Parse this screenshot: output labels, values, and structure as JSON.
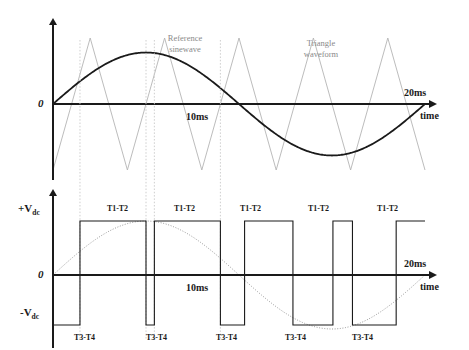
{
  "figure": {
    "width": 469,
    "height": 350,
    "colors": {
      "ink": "#1a1a1a",
      "carrier": "#b4b4b4",
      "guide": "#c8c8c8",
      "annotation": "#8a8a8a",
      "background": "#ffffff"
    }
  },
  "chart_data": [
    {
      "type": "line",
      "id": "modulation-comparison",
      "title": "",
      "xlabel": "time",
      "ylabel": "",
      "xlim": [
        0,
        20
      ],
      "ylim": [
        -1.25,
        1.25
      ],
      "grid": false,
      "legend": "inline-annotations",
      "xticks": [
        10,
        20
      ],
      "xtick_labels": [
        "10ms",
        "20ms"
      ],
      "yticks": [
        0
      ],
      "ytick_labels": [
        "0"
      ],
      "annotations": [
        "Reference sinewave",
        "Triangle waveform"
      ],
      "series": [
        {
          "name": "Reference sinewave",
          "kind": "sine",
          "amplitude": 0.78,
          "period_ms": 20,
          "phase": 0,
          "color": "#1a1a1a",
          "width": 1.8
        },
        {
          "name": "Triangle waveform",
          "kind": "triangle",
          "amplitude": 1.0,
          "period_ms": 4,
          "cycles": 5,
          "color": "#b4b4b4",
          "width": 0.9
        }
      ]
    },
    {
      "type": "line",
      "id": "pwm-output",
      "title": "",
      "xlabel": "time",
      "ylabel": "",
      "xlim": [
        0,
        20
      ],
      "ylim": [
        -1.35,
        1.35
      ],
      "grid": false,
      "xticks": [
        10,
        20
      ],
      "xtick_labels": [
        "10ms",
        "20ms"
      ],
      "yticks": [
        1,
        0,
        -1
      ],
      "ytick_labels": [
        "+Vdc",
        "0",
        "-Vdc"
      ],
      "series": [
        {
          "name": "PWM output",
          "kind": "square-bipolar",
          "color": "#1a1a1a",
          "width": 1.1,
          "levels_ms": [
            [
              0.0,
              1.45,
              -1
            ],
            [
              1.45,
              5.0,
              1
            ],
            [
              5.0,
              5.45,
              -1
            ],
            [
              5.45,
              9.0,
              1
            ],
            [
              9.0,
              10.3,
              -1
            ],
            [
              10.3,
              12.9,
              1
            ],
            [
              12.9,
              15.05,
              -1
            ],
            [
              15.05,
              16.1,
              1
            ],
            [
              16.1,
              18.45,
              -1
            ],
            [
              18.45,
              20.0,
              1
            ]
          ]
        },
        {
          "name": "Reference sinewave (dotted overlay)",
          "kind": "sine",
          "amplitude": 0.78,
          "period_ms": 20,
          "phase": 0,
          "color": "#808080",
          "width": 0.8,
          "dash": "1,1.6"
        }
      ],
      "pulse_labels_top": [
        "T1-T2",
        "T1-T2",
        "T1-T2",
        "T1-T2",
        "T1-T2"
      ],
      "pulse_labels_bottom": [
        "T3-T4",
        "T3-T4",
        "T3-T4",
        "T3-T4",
        "T3-T4"
      ]
    }
  ],
  "top_chart": {
    "zero_label": "0",
    "time_axis_label": "time",
    "midpoint_label": "10ms",
    "endpoint_label": "20ms",
    "sine_annotation_line1": "Reference",
    "sine_annotation_line2": "sinewave",
    "triangle_annotation_line1": "Triangle",
    "triangle_annotation_line2": "waveform"
  },
  "bottom_chart": {
    "zero_label": "0",
    "time_axis_label": "time",
    "midpoint_label": "10ms",
    "endpoint_label": "20ms",
    "positive_rail_main": "+V",
    "positive_rail_sub": "dc",
    "negative_rail_main": "-V",
    "negative_rail_sub": "dc",
    "top_labels": [
      {
        "text": "T1-T2",
        "x": 107
      },
      {
        "text": "T1-T2",
        "x": 174
      },
      {
        "text": "T1-T2",
        "x": 240
      },
      {
        "text": "T1-T2",
        "x": 308
      },
      {
        "text": "T1-T2",
        "x": 377
      }
    ],
    "bottom_labels": [
      {
        "text": "T3-T4",
        "x": 74
      },
      {
        "text": "T3-T4",
        "x": 146
      },
      {
        "text": "T3-T4",
        "x": 216
      },
      {
        "text": "T3-T4",
        "x": 285
      },
      {
        "text": "T3-T4",
        "x": 352
      }
    ]
  },
  "guide_lines_ms": [
    1.45,
    5.0,
    5.45,
    9.0
  ]
}
